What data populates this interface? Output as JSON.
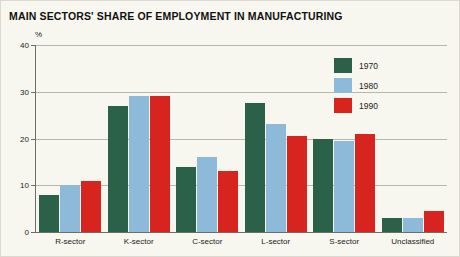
{
  "chart_data": {
    "type": "bar",
    "title": "MAIN SECTORS' SHARE OF EMPLOYMENT IN MANUFACTURING",
    "xlabel": "",
    "ylabel": "%",
    "ylim": [
      0,
      40
    ],
    "yticks": [
      0,
      10,
      20,
      30,
      40
    ],
    "grid": true,
    "legend_position": "upper-right",
    "categories": [
      "R-sector",
      "K-sector",
      "C-sector",
      "L-sector",
      "S-sector",
      "Unclassified"
    ],
    "series": [
      {
        "name": "1970",
        "color": "#2c6149",
        "values": [
          8,
          27,
          14,
          27.5,
          20,
          3
        ]
      },
      {
        "name": "1980",
        "color": "#8cbad8",
        "values": [
          10,
          29,
          16,
          23,
          19.5,
          3
        ]
      },
      {
        "name": "1990",
        "color": "#d8241e",
        "values": [
          11,
          29,
          13,
          20.5,
          21,
          4.5
        ]
      }
    ]
  }
}
